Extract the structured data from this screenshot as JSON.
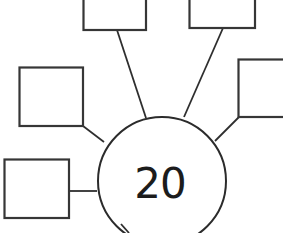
{
  "page": {
    "background_color": "#ffffff",
    "ink_color": "#2e2e2e"
  },
  "diagram": {
    "type": "spider-diagram",
    "center": {
      "shape": "circle",
      "label": "20"
    },
    "boxes": [
      {
        "id": "top-left",
        "label": "",
        "clipped_edge": "top"
      },
      {
        "id": "top-right",
        "label": "",
        "clipped_edge": "top"
      },
      {
        "id": "left",
        "label": "",
        "clipped_edge": ""
      },
      {
        "id": "right",
        "label": "",
        "clipped_edge": "right"
      },
      {
        "id": "bottom-left",
        "label": "",
        "clipped_edge": ""
      }
    ]
  }
}
